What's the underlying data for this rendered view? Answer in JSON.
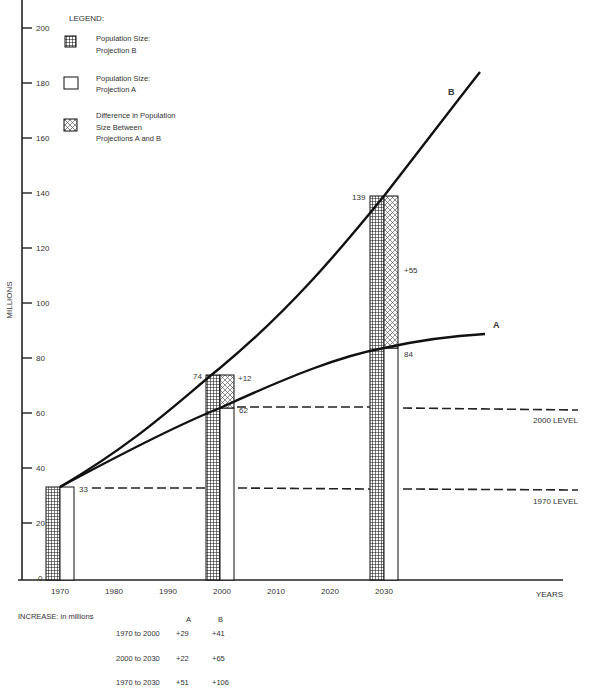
{
  "chart_data": {
    "type": "bar",
    "title": "",
    "xlabel": "YEARS",
    "ylabel": "MILLIONS",
    "ylim": [
      0,
      200
    ],
    "yticks": [
      0,
      20,
      40,
      60,
      80,
      100,
      120,
      140,
      160,
      180,
      200
    ],
    "xticks": [
      "1970",
      "1980",
      "1990",
      "2000",
      "2010",
      "2020",
      "2030"
    ],
    "grid": false,
    "legend_title": "LEGEND:",
    "legend": [
      {
        "key": "projB",
        "label_line1": "Population Size:",
        "label_line2": "Projection B",
        "pattern": "grid"
      },
      {
        "key": "projA",
        "label_line1": "Population Size:",
        "label_line2": "Projection A",
        "pattern": "empty"
      },
      {
        "key": "diff",
        "label_line1": "Difference in Population",
        "label_line2": "Size Between",
        "label_line3": "Projections A and B",
        "pattern": "crosshatch"
      }
    ],
    "categories": [
      "1970",
      "2000",
      "2030"
    ],
    "series": [
      {
        "name": "Projection B",
        "values": [
          33,
          74,
          139
        ]
      },
      {
        "name": "Projection A",
        "values": [
          33,
          62,
          84
        ]
      },
      {
        "name": "Difference (B - A)",
        "values": [
          0,
          12,
          55
        ]
      }
    ],
    "bar_labels": {
      "1970": {
        "value": "33"
      },
      "2000": {
        "b": "74",
        "a": "62",
        "diff": "+12"
      },
      "2030": {
        "b": "139",
        "a": "84",
        "diff": "+55"
      }
    },
    "curves": [
      {
        "name": "B",
        "points": [
          [
            1970,
            33
          ],
          [
            2000,
            77
          ],
          [
            2030,
            140
          ],
          [
            2045,
            184
          ]
        ]
      },
      {
        "name": "A",
        "points": [
          [
            1970,
            33
          ],
          [
            2000,
            61
          ],
          [
            2030,
            84
          ],
          [
            2045,
            89
          ]
        ]
      }
    ],
    "reference_lines": [
      {
        "label": "2000 LEVEL",
        "value": 62
      },
      {
        "label": "1970 LEVEL",
        "value": 33
      }
    ],
    "increase_table": {
      "title": "INCREASE: in millions",
      "columns": [
        "A",
        "B"
      ],
      "rows": [
        {
          "period": "1970 to 2000",
          "A": "+29",
          "B": "+41"
        },
        {
          "period": "2000 to 2030",
          "A": "+22",
          "B": "+65"
        },
        {
          "period": "1970 to 2030",
          "A": "+51",
          "B": "+106"
        }
      ]
    }
  }
}
